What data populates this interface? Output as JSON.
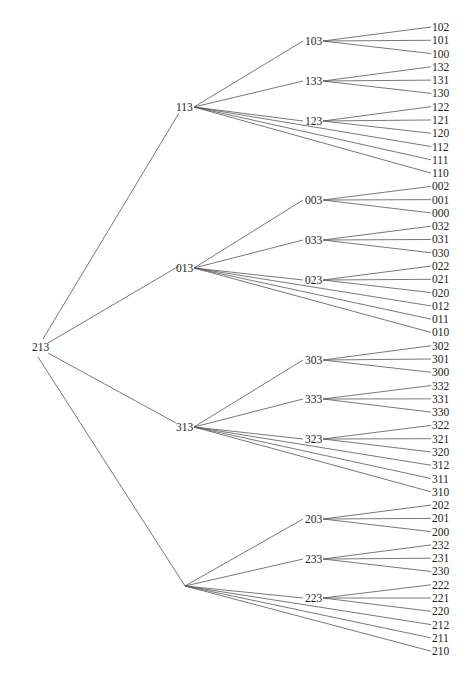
{
  "diagram": {
    "type": "tree",
    "root": {
      "label": "213",
      "x": 32,
      "y": 347,
      "anchor_x": 48
    },
    "level1": [
      {
        "label": "113",
        "x": 176,
        "y": 107
      },
      {
        "label": "013",
        "x": 176,
        "y": 268
      },
      {
        "label": "313",
        "x": 176,
        "y": 427
      },
      {
        "label": "",
        "x": 185,
        "y": 586
      }
    ],
    "level2": [
      {
        "label": "103",
        "parent": 0,
        "y": 41,
        "children": [
          "102",
          "101",
          "100"
        ]
      },
      {
        "label": "133",
        "parent": 0,
        "y": 81,
        "children": [
          "132",
          "131",
          "130"
        ]
      },
      {
        "label": "123",
        "parent": 0,
        "y": 121,
        "children": [
          "122",
          "121",
          "120"
        ]
      },
      {
        "label": "003",
        "parent": 1,
        "y": 200,
        "children": [
          "002",
          "001",
          "000"
        ]
      },
      {
        "label": "033",
        "parent": 1,
        "y": 240,
        "children": [
          "032",
          "031",
          "030"
        ]
      },
      {
        "label": "023",
        "parent": 1,
        "y": 280,
        "children": [
          "022",
          "021",
          "020"
        ]
      },
      {
        "label": "303",
        "parent": 2,
        "y": 360,
        "children": [
          "302",
          "301",
          "300"
        ]
      },
      {
        "label": "333",
        "parent": 2,
        "y": 399,
        "children": [
          "332",
          "331",
          "330"
        ]
      },
      {
        "label": "323",
        "parent": 2,
        "y": 439,
        "children": [
          "322",
          "321",
          "320"
        ]
      },
      {
        "label": "203",
        "parent": 3,
        "y": 519,
        "children": [
          "202",
          "201",
          "200"
        ]
      },
      {
        "label": "233",
        "parent": 3,
        "y": 559,
        "children": [
          "232",
          "231",
          "230"
        ]
      },
      {
        "label": "223",
        "parent": 3,
        "y": 598,
        "children": [
          "222",
          "221",
          "220"
        ]
      }
    ],
    "direct_leaves": [
      {
        "parent": 0,
        "labels": [
          "112",
          "111",
          "110"
        ]
      },
      {
        "parent": 1,
        "labels": [
          "012",
          "011",
          "010"
        ]
      },
      {
        "parent": 2,
        "labels": [
          "312",
          "311",
          "310"
        ]
      },
      {
        "parent": 3,
        "labels": [
          "212",
          "211",
          "210"
        ]
      }
    ],
    "leaves_order": [
      "102",
      "101",
      "100",
      "132",
      "131",
      "130",
      "122",
      "121",
      "120",
      "112",
      "111",
      "110",
      "002",
      "001",
      "000",
      "032",
      "031",
      "030",
      "022",
      "021",
      "020",
      "012",
      "011",
      "010",
      "302",
      "301",
      "300",
      "332",
      "331",
      "330",
      "322",
      "321",
      "320",
      "312",
      "311",
      "310",
      "202",
      "201",
      "200",
      "232",
      "231",
      "230",
      "222",
      "221",
      "220",
      "212",
      "211",
      "210"
    ],
    "leaf_x": 432,
    "leaf_y_start": 27,
    "leaf_y_step": 13.28,
    "mid_x": 305
  }
}
